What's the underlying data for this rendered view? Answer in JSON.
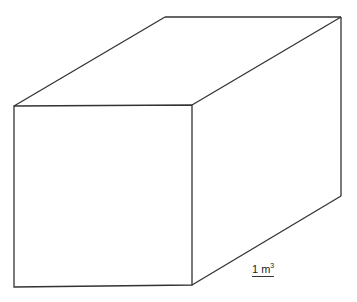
{
  "figure": {
    "type": "cuboid-diagram",
    "stroke_color": "#333333",
    "background": "#ffffff",
    "label": {
      "value": "1 m",
      "exponent": "3",
      "underlined": true
    },
    "top_text_cutoff": ""
  }
}
